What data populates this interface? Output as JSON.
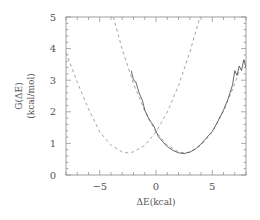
{
  "chart_data": {
    "type": "line",
    "title": "",
    "xlabel": "ΔE(kcal)",
    "ylabel_line1": "G(ΔE)",
    "ylabel_line2": "(kcal/mol)",
    "xlim": [
      -8,
      8
    ],
    "ylim": [
      0,
      5
    ],
    "grid": false,
    "legend": null,
    "x_ticks": [
      -5,
      0,
      5
    ],
    "x_tick_labels": [
      "−5",
      "0",
      "5"
    ],
    "y_ticks": [
      0,
      1,
      2,
      3,
      4,
      5
    ],
    "y_tick_labels": [
      "0",
      "1",
      "2",
      "3",
      "4",
      "5"
    ],
    "series": [
      {
        "name": "left-parabola",
        "style": "dashed",
        "x": [
          -8,
          -7,
          -6,
          -5,
          -4,
          -3,
          -2.5,
          -2,
          -1,
          0,
          1,
          2,
          3,
          3.9
        ],
        "values": [
          3.88,
          2.93,
          2.09,
          1.36,
          0.94,
          0.73,
          0.7,
          0.73,
          0.94,
          1.36,
          1.99,
          2.83,
          3.88,
          5.0
        ]
      },
      {
        "name": "right-parabola",
        "style": "dashed",
        "x": [
          -3.8,
          -3,
          -2,
          -1,
          0,
          1,
          2,
          2.5,
          3,
          4,
          5,
          6,
          7,
          7.4
        ],
        "values": [
          5.0,
          3.97,
          2.89,
          2.02,
          1.36,
          0.94,
          0.73,
          0.7,
          0.73,
          0.94,
          1.36,
          2.02,
          2.89,
          3.3
        ]
      },
      {
        "name": "simulated",
        "style": "solid",
        "x": [
          -2.2,
          -2.0,
          -1.8,
          -1.5,
          -1.2,
          -1.0,
          -0.6,
          -0.2,
          0.2,
          0.6,
          1.0,
          1.5,
          2.0,
          2.5,
          3.0,
          3.5,
          4.0,
          4.5,
          5.0,
          5.5,
          6.0,
          6.4,
          6.8,
          7.0,
          7.2,
          7.4,
          7.6,
          7.8,
          8.0
        ],
        "values": [
          3.3,
          3.0,
          2.95,
          2.6,
          2.35,
          2.05,
          1.75,
          1.55,
          1.22,
          1.05,
          0.9,
          0.78,
          0.7,
          0.68,
          0.72,
          0.82,
          0.98,
          1.18,
          1.38,
          1.7,
          2.05,
          2.4,
          2.85,
          3.3,
          3.15,
          3.45,
          3.3,
          3.65,
          3.4
        ]
      }
    ]
  }
}
